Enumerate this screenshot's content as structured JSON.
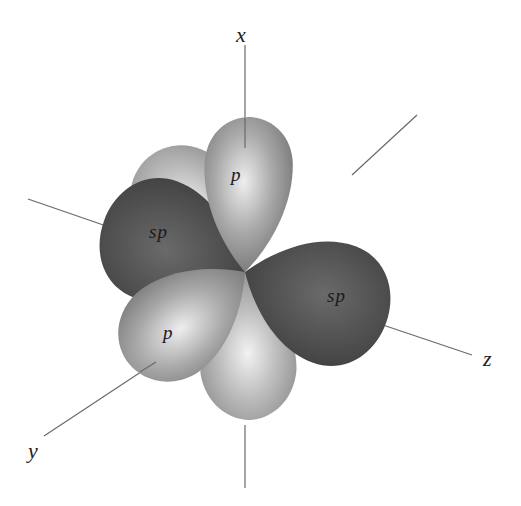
{
  "diagram": {
    "axes": {
      "x": "x",
      "y": "y",
      "z": "z"
    },
    "lobes": {
      "sp_left": "sp",
      "sp_right": "sp",
      "p_top": "p",
      "p_bottom": "p"
    },
    "colors": {
      "sp_lobe": "#4a4a4a",
      "p_lobe": "#9a9a9a",
      "p_highlight": "#e8e8e8",
      "axis_line": "#6a6a6a",
      "background": "#ffffff"
    }
  }
}
